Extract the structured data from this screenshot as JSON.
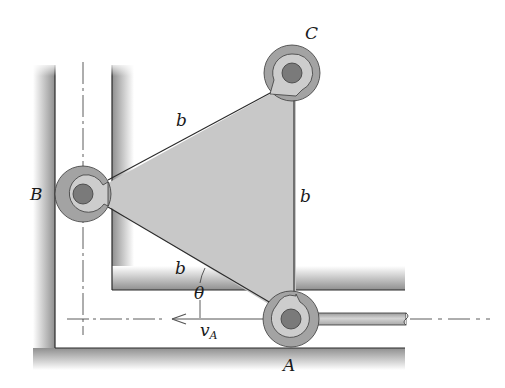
{
  "figure": {
    "type": "mechanism-diagram",
    "colors": {
      "plate_fill": "#c8c8c8",
      "pin_outer_ring": "#a0a0a0",
      "pin_inner_ring": "#cdcdcd",
      "pin_core": "#7a7a7a",
      "wall_shade": "#9a9a9a",
      "line": "#2a2a2a",
      "background": "#ffffff"
    },
    "labels": {
      "pin_B": "B",
      "pin_C": "C",
      "pin_A": "A",
      "side_BC": "b",
      "side_CA": "b",
      "side_BA": "b",
      "angle": "θ",
      "velocity_symbol": "v",
      "velocity_subscript": "A"
    }
  }
}
